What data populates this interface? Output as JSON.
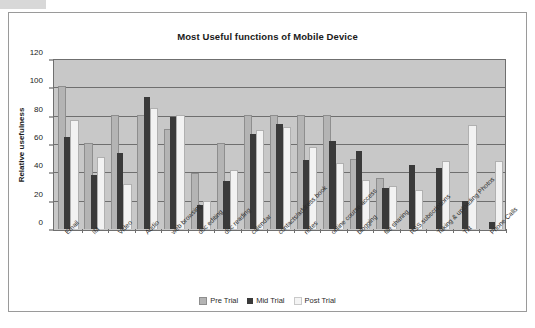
{
  "chart_data": {
    "type": "bar",
    "title": "Most Useful functions of Mobile Device",
    "xlabel": "",
    "ylabel": "Relative usefulness",
    "ylim": [
      0,
      120
    ],
    "yticks": [
      0,
      20,
      40,
      60,
      80,
      100,
      120
    ],
    "grid": true,
    "legend_position": "bottom",
    "categories": [
      "Email",
      "IM",
      "Video",
      "Audio",
      "web browsing",
      "doc editing",
      "doc reading",
      "calendar",
      "contacts/address book",
      "notes",
      "online course access",
      "blogging",
      "file sharing",
      "RSS subscriptions",
      "Taking & uploading Photos",
      "Txt",
      "Phone Calls"
    ],
    "series": [
      {
        "name": "Pre Trial",
        "color": "#b4b4b4",
        "values": [
          100,
          60,
          80,
          80,
          70,
          39,
          60,
          80,
          80,
          80,
          80,
          49,
          35,
          0,
          0,
          0,
          0
        ]
      },
      {
        "name": "Mid Trial",
        "color": "#3a3a3a",
        "values": [
          65,
          38,
          54,
          93,
          79,
          17,
          34,
          67,
          74,
          49,
          62,
          55,
          29,
          45,
          43,
          20,
          5
        ]
      },
      {
        "name": "Post Trial",
        "color": "#f2f2f2",
        "values": [
          76,
          50,
          31,
          85,
          80,
          19,
          41,
          69,
          71,
          57,
          46,
          34,
          30,
          27,
          47,
          73,
          47
        ]
      }
    ]
  },
  "legend": {
    "items": [
      {
        "label": "Pre Trial"
      },
      {
        "label": "Mid Trial"
      },
      {
        "label": "Post Trial"
      }
    ]
  }
}
